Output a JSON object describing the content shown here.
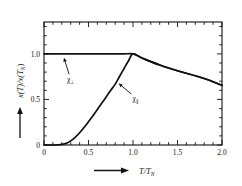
{
  "figure": {
    "background": "#ffffff",
    "ink": "#111111"
  },
  "axes": {
    "x_title_main": "T/T",
    "x_title_sub": "N",
    "y_title_part1": "x(T)/x(T",
    "y_title_sub": "N",
    "y_title_part2": ")",
    "x_ticklabels": [
      "0",
      "0.5",
      "1.0",
      "1.5",
      "2.0"
    ],
    "x_tickvalues": [
      0,
      0.5,
      1.0,
      1.5,
      2.0
    ],
    "y_ticklabels": [
      "0",
      "0.5",
      "1.0"
    ],
    "y_tickvalues": [
      0,
      0.5,
      1.0
    ],
    "arrow_x": "arrow-right",
    "arrow_y": "arrow-up"
  },
  "labels": {
    "perp": {
      "symbol": "χ",
      "subscript": "⊥",
      "name": "chi-perpendicular"
    },
    "para": {
      "symbol": "χ",
      "subscript": "∥",
      "name": "chi-parallel"
    }
  },
  "chart_data": {
    "type": "line",
    "title": "",
    "xlabel": "T/T_N",
    "ylabel": "x(T)/x(T_N)",
    "xlim": [
      0,
      2.0
    ],
    "ylim": [
      0,
      1.35
    ],
    "grid": false,
    "legend": "inline-annotations",
    "x_major_ticks": [
      0,
      0.5,
      1.0,
      1.5,
      2.0
    ],
    "x_minor_tick_step": 0.1,
    "y_major_ticks": [
      0,
      0.5,
      1.0
    ],
    "y_minor_tick_step": 0.1,
    "series": [
      {
        "name": "chi-perpendicular",
        "label": "χ⊥",
        "x": [
          0.0,
          0.1,
          0.2,
          0.3,
          0.4,
          0.5,
          0.6,
          0.7,
          0.8,
          0.9,
          1.0,
          1.1,
          1.2,
          1.3,
          1.4,
          1.5,
          1.6,
          1.7,
          1.8,
          1.9,
          2.0
        ],
        "values": [
          1.0,
          1.0,
          1.0,
          1.0,
          1.0,
          1.0,
          1.0,
          1.0,
          1.0,
          1.0,
          1.0,
          0.955,
          0.915,
          0.878,
          0.845,
          0.815,
          0.787,
          0.76,
          0.73,
          0.695,
          0.655
        ]
      },
      {
        "name": "chi-parallel",
        "label": "χ∥",
        "x": [
          0.0,
          0.05,
          0.1,
          0.15,
          0.2,
          0.25,
          0.3,
          0.35,
          0.4,
          0.45,
          0.5,
          0.55,
          0.6,
          0.65,
          0.7,
          0.75,
          0.8,
          0.85,
          0.9,
          0.95,
          1.0,
          1.1,
          1.2,
          1.3,
          1.4,
          1.5,
          1.6,
          1.7,
          1.8,
          1.9,
          2.0
        ],
        "values": [
          0.0,
          0.0,
          0.0,
          0.002,
          0.006,
          0.018,
          0.045,
          0.085,
          0.135,
          0.192,
          0.255,
          0.32,
          0.39,
          0.46,
          0.53,
          0.6,
          0.668,
          0.755,
          0.84,
          0.925,
          1.0,
          0.955,
          0.915,
          0.878,
          0.845,
          0.815,
          0.787,
          0.76,
          0.73,
          0.695,
          0.655
        ]
      }
    ],
    "annotations": [
      {
        "text": "χ⊥",
        "at_x": 0.3,
        "at_y": 0.72,
        "points_to_x": 0.215,
        "points_to_y": 0.985
      },
      {
        "text": "χ∥",
        "at_x": 1.03,
        "at_y": 0.52,
        "points_to_x": 0.815,
        "points_to_y": 0.695
      }
    ]
  }
}
